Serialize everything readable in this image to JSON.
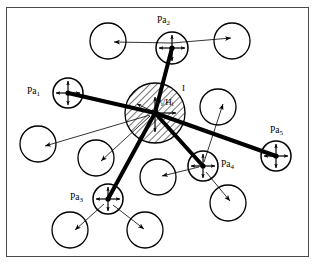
{
  "figure": {
    "type": "node-link-diagram",
    "background_color": "#ffffff",
    "stroke_color": "#000000",
    "frame_color": "#4a4a4a",
    "width": 318,
    "height": 266
  },
  "center_node": {
    "name": "center-node",
    "label_main": "P",
    "label_sub1": "i",
    "label_sep": "/H",
    "label_sub2": "i",
    "label_full": "Pi/Hi",
    "mark": "I",
    "cx": 155,
    "cy": 113,
    "r": 30,
    "hatched": true,
    "hatch_angle_deg": 45
  },
  "primary_nodes": [
    {
      "id": "pa1",
      "label_prefix": "Pa",
      "label_sub": "1",
      "label_full": "Pa1",
      "cx": 68,
      "cy": 93,
      "r": 15,
      "label_x": 27,
      "label_y": 88,
      "cross_arrows": true
    },
    {
      "id": "pa2",
      "label_prefix": "Pa",
      "label_sub": "2",
      "label_full": "Pa2",
      "cx": 172,
      "cy": 48,
      "r": 16,
      "label_x": 157,
      "label_y": 18,
      "cross_arrows": true
    },
    {
      "id": "pa3",
      "label_prefix": "Pa",
      "label_sub": "3",
      "label_full": "Pa3",
      "cx": 108,
      "cy": 199,
      "r": 15,
      "label_x": 70,
      "label_y": 194,
      "cross_arrows": true
    },
    {
      "id": "pa4",
      "label_prefix": "Pa",
      "label_sub": "4",
      "label_full": "Pa4",
      "cx": 203,
      "cy": 166,
      "r": 15,
      "label_x": 221,
      "label_y": 165,
      "cross_arrows": true
    },
    {
      "id": "pa5",
      "label_prefix": "Pa",
      "label_sub": "5",
      "label_full": "Pa5",
      "cx": 276,
      "cy": 156,
      "r": 15,
      "label_x": 270,
      "label_y": 128,
      "cross_arrows": true
    }
  ],
  "secondary_nodes": [
    {
      "id": "s1",
      "cx": 108,
      "cy": 41,
      "r": 18
    },
    {
      "id": "s2",
      "cx": 232,
      "cy": 41,
      "r": 18
    },
    {
      "id": "s3",
      "cx": 38,
      "cy": 144,
      "r": 18
    },
    {
      "id": "s4",
      "cx": 96,
      "cy": 158,
      "r": 18
    },
    {
      "id": "s5",
      "cx": 218,
      "cy": 107,
      "r": 18
    },
    {
      "id": "s6",
      "cx": 158,
      "cy": 177,
      "r": 18
    },
    {
      "id": "s7",
      "cx": 228,
      "cy": 203,
      "r": 18
    },
    {
      "id": "s8",
      "cx": 70,
      "cy": 230,
      "r": 18
    },
    {
      "id": "s9",
      "cx": 145,
      "cy": 230,
      "r": 18
    }
  ],
  "thick_edges": [
    {
      "from": "center",
      "to": "pa1",
      "x1": 155,
      "y1": 113,
      "x2": 68,
      "y2": 93
    },
    {
      "from": "center",
      "to": "pa2",
      "x1": 155,
      "y1": 113,
      "x2": 172,
      "y2": 48
    },
    {
      "from": "center",
      "to": "pa3",
      "x1": 155,
      "y1": 113,
      "x2": 108,
      "y2": 199
    },
    {
      "from": "center",
      "to": "pa4",
      "x1": 155,
      "y1": 113,
      "x2": 203,
      "y2": 166
    },
    {
      "from": "center",
      "to": "pa5",
      "x1": 155,
      "y1": 113,
      "x2": 276,
      "y2": 156
    }
  ],
  "thin_arrows": [
    {
      "from": "pa2",
      "to": "s1",
      "x1": 172,
      "y1": 43,
      "x2": 112,
      "y2": 42
    },
    {
      "from": "pa2",
      "to": "s2",
      "x1": 172,
      "y1": 43,
      "x2": 229,
      "y2": 38
    },
    {
      "from": "center",
      "to": "s3",
      "x1": 150,
      "y1": 115,
      "x2": 43,
      "y2": 146
    },
    {
      "from": "center",
      "to": "s4",
      "x1": 150,
      "y1": 115,
      "x2": 100,
      "y2": 161
    },
    {
      "from": "pa4",
      "to": "s5",
      "x1": 204,
      "y1": 161,
      "x2": 222,
      "y2": 105
    },
    {
      "from": "pa4",
      "to": "s6",
      "x1": 198,
      "y1": 167,
      "x2": 161,
      "y2": 176
    },
    {
      "from": "pa4",
      "to": "s7",
      "x1": 206,
      "y1": 172,
      "x2": 229,
      "y2": 200
    },
    {
      "from": "pa3",
      "to": "s8",
      "x1": 104,
      "y1": 204,
      "x2": 74,
      "y2": 229
    },
    {
      "from": "pa3",
      "to": "s9",
      "x1": 113,
      "y1": 205,
      "x2": 143,
      "y2": 228
    },
    {
      "from": "center",
      "to": "cin",
      "x1": 152,
      "y1": 111,
      "x2": 136,
      "y2": 103
    }
  ]
}
